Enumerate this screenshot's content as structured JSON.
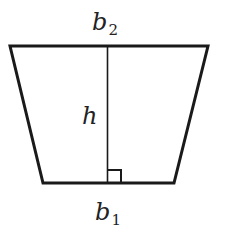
{
  "diagram": {
    "type": "trapezoid",
    "labels": {
      "top_base": {
        "main": "b",
        "sub": "2"
      },
      "height": {
        "main": "h"
      },
      "bottom_base": {
        "main": "b",
        "sub": "1"
      }
    },
    "right_angle_marker": true,
    "colors": {
      "stroke": "#1a1a1a",
      "background": "#ffffff",
      "text": "#222222"
    }
  }
}
